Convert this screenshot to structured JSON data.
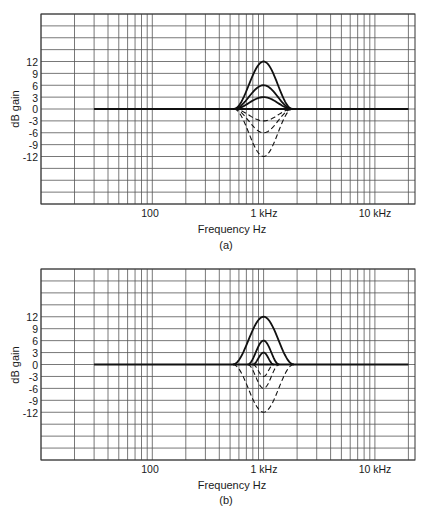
{
  "chart_data": [
    {
      "id": "a",
      "type": "line",
      "caption": "(a)",
      "title": "",
      "xlabel": "Frequency Hz",
      "ylabel": "dB gain",
      "xscale": "log",
      "xlim": [
        10,
        22900
      ],
      "ylim": [
        -24,
        24
      ],
      "grid": true,
      "x_tick_labels": [
        {
          "value": 100,
          "label": "100"
        },
        {
          "value": 1000,
          "label": "1 kHz"
        },
        {
          "value": 10000,
          "label": "10 kHz"
        }
      ],
      "y_tick_labels": [
        "12",
        "9",
        "6",
        "3",
        "0",
        "-3",
        "-6",
        "-9",
        "-12"
      ],
      "y_tick_values": [
        12,
        9,
        6,
        3,
        0,
        -3,
        -6,
        -9,
        -12
      ],
      "baseline": {
        "from_hz": 30,
        "to_hz": 20000,
        "gain_db": 0
      },
      "series": [
        {
          "name": "boost +12 dB",
          "center_hz": 1000,
          "gain_db": 12,
          "low_hz": 540,
          "high_hz": 1820,
          "style": "solid"
        },
        {
          "name": "boost +6 dB",
          "center_hz": 1000,
          "gain_db": 6,
          "low_hz": 540,
          "high_hz": 1820,
          "style": "solid"
        },
        {
          "name": "boost +3 dB",
          "center_hz": 1000,
          "gain_db": 3,
          "low_hz": 540,
          "high_hz": 1820,
          "style": "solid"
        },
        {
          "name": "cut -3 dB",
          "center_hz": 1000,
          "gain_db": -3,
          "low_hz": 540,
          "high_hz": 1820,
          "style": "dashed"
        },
        {
          "name": "cut -6 dB",
          "center_hz": 1000,
          "gain_db": -6,
          "low_hz": 540,
          "high_hz": 1820,
          "style": "dashed"
        },
        {
          "name": "cut -12 dB",
          "center_hz": 1000,
          "gain_db": -12,
          "low_hz": 540,
          "high_hz": 1820,
          "style": "dashed"
        }
      ]
    },
    {
      "id": "b",
      "type": "line",
      "caption": "(b)",
      "title": "",
      "xlabel": "Frequency Hz",
      "ylabel": "dB gain",
      "xscale": "log",
      "xlim": [
        10,
        22900
      ],
      "ylim": [
        -24,
        24
      ],
      "grid": true,
      "x_tick_labels": [
        {
          "value": 100,
          "label": "100"
        },
        {
          "value": 1000,
          "label": "1 kHz"
        },
        {
          "value": 10000,
          "label": "10 kHz"
        }
      ],
      "y_tick_labels": [
        "12",
        "9",
        "6",
        "3",
        "0",
        "-3",
        "-6",
        "-9",
        "-12"
      ],
      "y_tick_values": [
        12,
        9,
        6,
        3,
        0,
        -3,
        -6,
        -9,
        -12
      ],
      "baseline": {
        "from_hz": 30,
        "to_hz": 20000,
        "gain_db": 0
      },
      "series": [
        {
          "name": "boost +12 dB",
          "center_hz": 1000,
          "gain_db": 12,
          "low_hz": 530,
          "high_hz": 1870,
          "style": "solid"
        },
        {
          "name": "boost +6 dB",
          "center_hz": 1000,
          "gain_db": 6,
          "low_hz": 720,
          "high_hz": 1380,
          "style": "solid"
        },
        {
          "name": "boost +3 dB",
          "center_hz": 1000,
          "gain_db": 3,
          "low_hz": 800,
          "high_hz": 1230,
          "style": "solid"
        },
        {
          "name": "cut -3 dB",
          "center_hz": 1000,
          "gain_db": -3,
          "low_hz": 800,
          "high_hz": 1230,
          "style": "dashed"
        },
        {
          "name": "cut -6 dB",
          "center_hz": 1000,
          "gain_db": -6,
          "low_hz": 720,
          "high_hz": 1380,
          "style": "dashed"
        },
        {
          "name": "cut -12 dB",
          "center_hz": 1000,
          "gain_db": -12,
          "low_hz": 530,
          "high_hz": 1870,
          "style": "dashed"
        }
      ]
    }
  ],
  "labels": {
    "a": {
      "ylabel": "dB gain",
      "xlabel": "Frequency Hz",
      "caption": "(a)",
      "xt100": "100",
      "xt1k": "1 kHz",
      "xt10k": "10 kHz",
      "yt": [
        "12",
        "9",
        "6",
        "3",
        "0",
        "-3",
        "-6",
        "-9",
        "-12"
      ]
    },
    "b": {
      "ylabel": "dB gain",
      "xlabel": "Frequency Hz",
      "caption": "(b)",
      "xt100": "100",
      "xt1k": "1 kHz",
      "xt10k": "10 kHz",
      "yt": [
        "12",
        "9",
        "6",
        "3",
        "0",
        "-3",
        "-6",
        "-9",
        "-12"
      ]
    }
  },
  "colors": {
    "grid": "#555555",
    "curve": "#111111",
    "background": "#ffffff"
  }
}
